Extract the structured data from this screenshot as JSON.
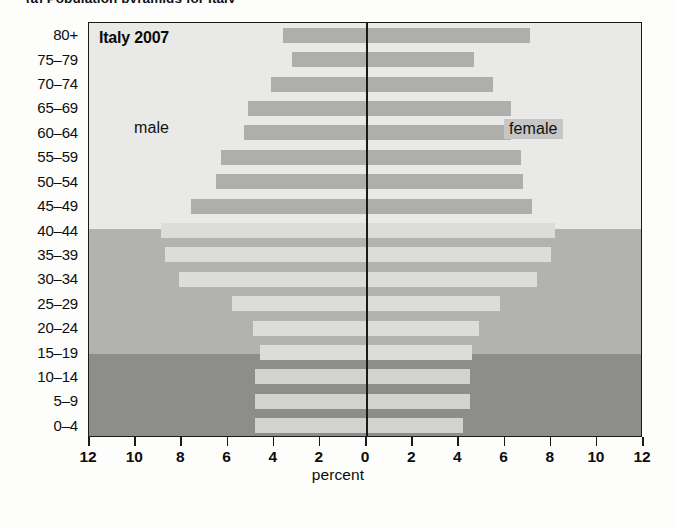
{
  "caption": "(a)   Population pyramids for Italy",
  "chart_data": {
    "type": "bar",
    "subtype": "population-pyramid",
    "title": "Italy 2007",
    "xlabel": "percent",
    "ylabel": "",
    "xlim": [
      -12,
      12
    ],
    "xticks": [
      12,
      10,
      8,
      6,
      4,
      2,
      0,
      2,
      4,
      6,
      8,
      10,
      12
    ],
    "xtick_values": [
      -12,
      -10,
      -8,
      -6,
      -4,
      -2,
      0,
      2,
      4,
      6,
      8,
      10,
      12
    ],
    "grid": false,
    "legend_position": "in-plot",
    "categories": [
      "80+",
      "75–79",
      "70–74",
      "65–69",
      "60–64",
      "55–59",
      "50–54",
      "45–49",
      "40–44",
      "35–39",
      "30–34",
      "25–29",
      "20–24",
      "15–19",
      "10–14",
      "5–9",
      "0–4"
    ],
    "series": [
      {
        "name": "male",
        "side": "left",
        "values": [
          3.6,
          3.2,
          4.1,
          5.1,
          5.3,
          6.3,
          6.5,
          7.6,
          8.9,
          8.7,
          8.1,
          5.8,
          4.9,
          4.6,
          4.8,
          4.8,
          4.8
        ]
      },
      {
        "name": "female",
        "side": "right",
        "values": [
          7.1,
          4.7,
          5.5,
          6.3,
          6.3,
          6.7,
          6.8,
          7.2,
          8.2,
          8.0,
          7.4,
          5.8,
          4.9,
          4.6,
          4.5,
          4.5,
          4.2
        ]
      }
    ],
    "bands": [
      {
        "name": "older",
        "categories": [
          "80+",
          "75–79",
          "70–74",
          "65–69",
          "60–64",
          "55–59",
          "50–54",
          "45–49"
        ],
        "color": "#e9e9e7"
      },
      {
        "name": "middle",
        "categories": [
          "40–44",
          "35–39",
          "30–34",
          "25–29",
          "20–24",
          "15–19"
        ],
        "color": "#b2b2b0"
      },
      {
        "name": "younger",
        "categories": [
          "10–14",
          "5–9",
          "0–4"
        ],
        "color": "#8d8d8b"
      }
    ],
    "annotations": [
      {
        "text": "Italy 2007",
        "position": "top-left"
      },
      {
        "text": "male",
        "position": "left-upper"
      },
      {
        "text": "female",
        "position": "right-upper"
      }
    ],
    "colors": {
      "bar": "#aeaeac",
      "bar_on_mid": "#dcdcda",
      "bar_on_dark": "#d2d2d0",
      "axis": "#1a1a1a",
      "text": "#0d0d0d"
    }
  },
  "labels": {
    "male": "male",
    "female": "female"
  }
}
